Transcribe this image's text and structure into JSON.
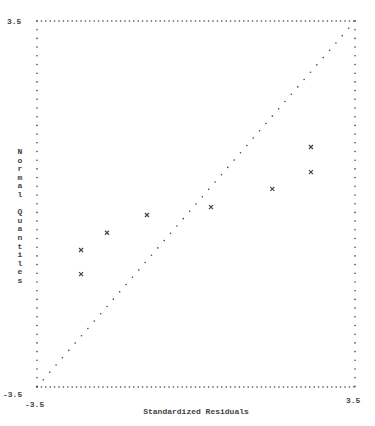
{
  "chart_data": {
    "type": "scatter",
    "title": "",
    "xlabel": "Standardized Residuals",
    "ylabel": "Normal Quantiles",
    "xlim": [
      -3.5,
      3.5
    ],
    "ylim": [
      -3.5,
      3.5
    ],
    "x_tick_labels": [
      "-3.5",
      "3.5"
    ],
    "y_tick_labels": [
      "3.5",
      "-3.5"
    ],
    "grid": false,
    "frame_style": "dotted",
    "marker": "x",
    "reference_line": {
      "style": "dotted",
      "from": [
        -3.5,
        -3.5
      ],
      "to": [
        3.5,
        3.5
      ]
    },
    "points": [
      {
        "x": -2.53,
        "y": -0.88
      },
      {
        "x": -2.53,
        "y": -1.34
      },
      {
        "x": -1.96,
        "y": -0.55
      },
      {
        "x": -1.08,
        "y": -0.21
      },
      {
        "x": 0.33,
        "y": -0.06
      },
      {
        "x": 1.68,
        "y": 0.29
      },
      {
        "x": 2.53,
        "y": 1.09
      },
      {
        "x": 2.53,
        "y": 0.61
      }
    ]
  },
  "labels": {
    "xlabel": "Standardized Residuals",
    "ylabel": "Normal Quantiles",
    "y_top": "3.5",
    "y_bottom": "-3.5",
    "x_left": "-3.5",
    "x_right": "3.5"
  },
  "colors": {
    "ink": "#444444",
    "background": "#ffffff"
  }
}
